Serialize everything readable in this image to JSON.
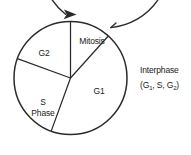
{
  "diagram": {
    "type": "pie-cycle",
    "background_color": "#ffffff",
    "line_color": "#2b2b2b",
    "text_color": "#1a1a1a"
  },
  "segments": [
    {
      "id": "mitosis",
      "label": "Mitosis",
      "start_angle_deg": 0,
      "end_angle_deg": 42,
      "label_x": 92,
      "label_y": 44
    },
    {
      "id": "g1",
      "label": "G1",
      "label_text": "G1",
      "start_angle_deg": 42,
      "end_angle_deg": 200,
      "label_x": 99,
      "label_y": 94
    },
    {
      "id": "s-phase",
      "label": "S Phase",
      "label_line1": "S",
      "label_line2": "Phase",
      "start_angle_deg": 200,
      "end_angle_deg": 250,
      "label_x": 43,
      "label_y": 105
    },
    {
      "id": "g2",
      "label": "G2",
      "label_text": "G2",
      "start_angle_deg": 250,
      "end_angle_deg": 360,
      "label_x": 44,
      "label_y": 56
    }
  ],
  "bracket": {
    "id": "interphase-bracket",
    "label_line1": "Interphase",
    "label_line2_prefix": "(G",
    "label_line2_sub1": "1",
    "label_line2_mid": ", S, G",
    "label_line2_sub2": "2",
    "label_line2_suffix": ")",
    "label_x": 140,
    "label_y1": 73,
    "label_y2": 88
  },
  "direction_arrow": {
    "id": "clockwise-arrow",
    "description": "clockwise cycle direction arrow at top"
  }
}
